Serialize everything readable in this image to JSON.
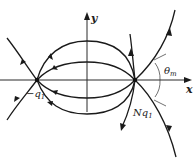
{
  "figure": {
    "axes": {
      "x_label": "x",
      "y_label": "y"
    },
    "charges": [
      {
        "id": "negative",
        "label_prefix": "−q",
        "label_sub": "1",
        "position": "left"
      },
      {
        "id": "positive",
        "label_prefix": "Nq",
        "label_sub": "1",
        "position": "right"
      }
    ],
    "angle": {
      "label_symbol": "θ",
      "label_sub": "m"
    },
    "colors": {
      "ink": "#1a1a1a",
      "background": "#ffffff"
    }
  }
}
